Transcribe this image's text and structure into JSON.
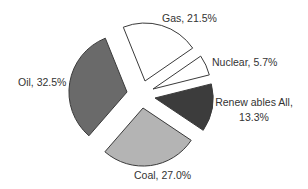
{
  "chart_data": {
    "type": "pie",
    "title": "",
    "exploded": true,
    "categories": [
      "Gas",
      "Nuclear",
      "Renewables All",
      "Coal",
      "Oil"
    ],
    "values": [
      21.5,
      5.7,
      13.3,
      27.0,
      32.5
    ],
    "unit": "%",
    "labels": [
      {
        "lines": [
          "Gas, 21.5%"
        ]
      },
      {
        "lines": [
          "Nuclear, 5.7%"
        ]
      },
      {
        "lines": [
          "Renew ables All,",
          "13.3%"
        ]
      },
      {
        "lines": [
          "Coal, 27.0%"
        ]
      },
      {
        "lines": [
          "Oil, 32.5%"
        ]
      }
    ],
    "colors": [
      "#ffffff",
      "#ffffff",
      "#3c3c3c",
      "#b4b4b4",
      "#6a6a6a"
    ],
    "legend": "none",
    "grid": false
  }
}
